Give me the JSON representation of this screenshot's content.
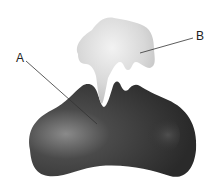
{
  "diagram": {
    "labels": [
      {
        "id": "A",
        "text": "A",
        "points_to": "dark lower molecule"
      },
      {
        "id": "B",
        "text": "B",
        "points_to": "light upper molecule"
      }
    ],
    "colors": {
      "molecule_a": "#3a3a3a",
      "molecule_a_highlight": "#8a8a8a",
      "molecule_b": "#d6d6d6",
      "molecule_b_highlight": "#f0f0f0",
      "leader_line": "#333333",
      "background": "#ffffff"
    }
  }
}
